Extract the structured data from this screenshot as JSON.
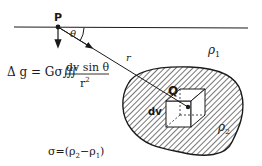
{
  "diagram": {
    "colors": {
      "ink": "#1a1a1a",
      "background": "#ffffff"
    },
    "labels": {
      "point_p": "P",
      "angle": "θ",
      "distance": "r",
      "point_q": "Q",
      "volume_element": "dv",
      "density_surrounding": "ρ",
      "density_surrounding_sub": "1",
      "density_body": "ρ",
      "density_body_sub": "2"
    },
    "formula": {
      "lhs": "Δ g = Gσ∭",
      "numerator": "dv sin θ",
      "denominator": "r",
      "denominator_exp": "2"
    },
    "contrast": {
      "text_a": "σ=(ρ",
      "sub_a": "2",
      "text_b": "−ρ",
      "sub_b": "1",
      "text_c": ")"
    }
  }
}
